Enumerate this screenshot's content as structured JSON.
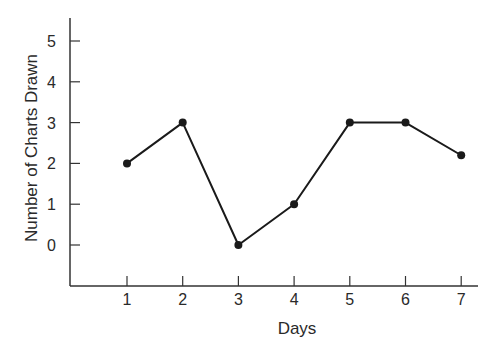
{
  "chart_data": {
    "type": "line",
    "title": "",
    "xlabel": "Days",
    "ylabel": "Number of Charts Drawn",
    "categories": [
      "1",
      "2",
      "3",
      "4",
      "5",
      "6",
      "7"
    ],
    "x": [
      1,
      2,
      3,
      4,
      5,
      6,
      7
    ],
    "series": [
      {
        "name": "Charts Drawn",
        "values": [
          2,
          3,
          0,
          1,
          3,
          3,
          2.2
        ]
      }
    ],
    "yticks": [
      0,
      1,
      2,
      3,
      4,
      5
    ],
    "ylim": [
      -1,
      5.5
    ],
    "xlim": [
      0,
      7.3
    ],
    "grid": false,
    "legend": "none",
    "markers": true,
    "line_color": "#1a1a1a"
  }
}
